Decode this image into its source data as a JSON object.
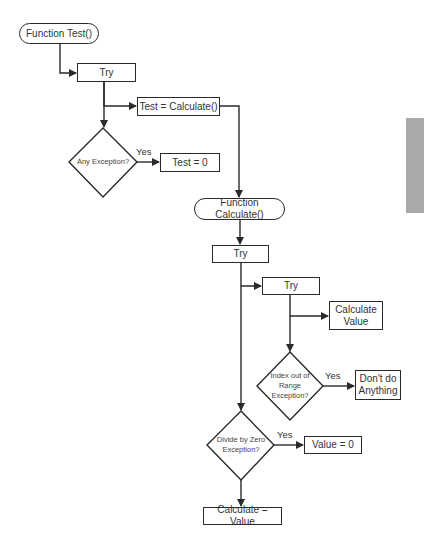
{
  "diagram": {
    "nodes": {
      "function_test": "Function Test()",
      "try_1": "Try",
      "test_calculate": "Test = Calculate()",
      "any_exception": "Any Exception?",
      "test_zero": "Test = 0",
      "function_calculate": "Function Calculate()",
      "try_2": "Try",
      "try_3": "Try",
      "calculate_value": "Calculate Value",
      "index_exception": "Index out of Range Exception?",
      "dont_do_anything": "Don't do Anything",
      "divide_exception": "Divide by Zero Exception?",
      "value_zero": "Value = 0",
      "calculate_eq_value": "Calculate = Value"
    },
    "edge_labels": {
      "any_yes": "Yes",
      "index_yes": "Yes",
      "divide_yes": "Yes"
    },
    "colors": {
      "line": "#2a2a2a",
      "side_tab": "#a9a9a9"
    }
  }
}
